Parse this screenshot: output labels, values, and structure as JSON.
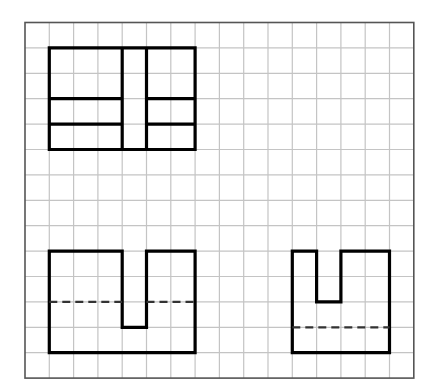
{
  "diagram": {
    "grid": {
      "origin_x": 25,
      "origin_y": 22.5,
      "cell_w": 24.3,
      "cell_h": 25.4,
      "cols": 16,
      "rows": 14,
      "grid_color": "#c4c4c4",
      "frame_color": "#555555"
    },
    "stroke": {
      "color": "#000000",
      "width": 3.2,
      "dash": "8,5"
    },
    "views": [
      {
        "name": "top-view",
        "outline": [
          [
            1,
            1
          ],
          [
            7,
            1
          ],
          [
            7,
            5
          ],
          [
            1,
            5
          ]
        ],
        "solid_lines": [
          [
            [
              4,
              1
            ],
            [
              4,
              5
            ]
          ],
          [
            [
              5,
              1
            ],
            [
              5,
              5
            ]
          ],
          [
            [
              1,
              3
            ],
            [
              4,
              3
            ]
          ],
          [
            [
              1,
              4
            ],
            [
              4,
              4
            ]
          ],
          [
            [
              5,
              3
            ],
            [
              7,
              3
            ]
          ],
          [
            [
              5,
              4
            ],
            [
              7,
              4
            ]
          ]
        ],
        "dashed_lines": []
      },
      {
        "name": "front-view",
        "outline": [
          [
            1,
            9
          ],
          [
            4,
            9
          ],
          [
            4,
            12
          ],
          [
            5,
            12
          ],
          [
            5,
            9
          ],
          [
            7,
            9
          ],
          [
            7,
            13
          ],
          [
            1,
            13
          ]
        ],
        "solid_lines": [],
        "dashed_lines": [
          [
            [
              1,
              11
            ],
            [
              4,
              11
            ]
          ],
          [
            [
              5,
              11
            ],
            [
              7,
              11
            ]
          ]
        ]
      },
      {
        "name": "side-view",
        "outline": [
          [
            11,
            9
          ],
          [
            12,
            9
          ],
          [
            12,
            11
          ],
          [
            13,
            11
          ],
          [
            13,
            9
          ],
          [
            15,
            9
          ],
          [
            15,
            13
          ],
          [
            11,
            13
          ]
        ],
        "solid_lines": [],
        "dashed_lines": [
          [
            [
              11,
              12
            ],
            [
              15,
              12
            ]
          ]
        ]
      }
    ]
  }
}
